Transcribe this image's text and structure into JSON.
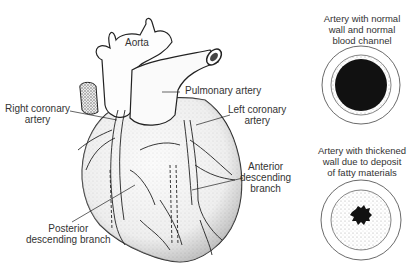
{
  "heart_diagram": {
    "labels": {
      "aorta": "Aorta",
      "pulmonary_artery": "Pulmonary artery",
      "right_coronary": [
        "Right coronary",
        "artery"
      ],
      "left_coronary": [
        "Left coronary",
        "artery"
      ],
      "anterior_descending": [
        "Anterior",
        "descending",
        "branch"
      ],
      "posterior_descending": [
        "Posterior",
        "descending branch"
      ]
    }
  },
  "cross_sections": [
    {
      "caption": [
        "Artery with normal",
        "wall and normal",
        "blood channel"
      ],
      "state": "normal"
    },
    {
      "caption": [
        "Artery with thickened",
        "wall due to deposit",
        "of fatty materials"
      ],
      "state": "narrowed"
    }
  ],
  "colors": {
    "ink": "#222222",
    "stipple": "#cfcfcf",
    "background": "#ffffff"
  }
}
